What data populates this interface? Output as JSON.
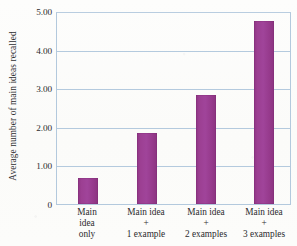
{
  "chart_data": {
    "type": "bar",
    "title": "",
    "subtitle": "",
    "xlabel": "",
    "ylabel": "Average number of main ideas recalled",
    "categories": [
      "Main idea only",
      "Main idea + 1 example",
      "Main idea + 2 examples",
      "Main idea + 3 examples"
    ],
    "category_lines": [
      [
        "Main",
        "idea",
        "only"
      ],
      [
        "Main idea",
        "+",
        "1 example"
      ],
      [
        "Main idea",
        "+",
        "2 examples"
      ],
      [
        "Main idea",
        "+",
        "3 examples"
      ]
    ],
    "values": [
      0.67,
      1.84,
      2.83,
      4.75
    ],
    "ylim": [
      0,
      5
    ],
    "ytick_values": [
      0,
      1,
      2,
      3,
      4,
      5
    ],
    "ytick_labels": [
      "0",
      "1.00",
      "2.00",
      "3.00",
      "4.00",
      "5.00"
    ],
    "grid": true,
    "grid_axis": "y",
    "legend": false,
    "legend_position": "none",
    "bar_color": "#9b3f91",
    "grid_color": "#b0c7dc",
    "axis_color": "#b3c9dd",
    "text_color": "#2b2b2d",
    "background_color": "#fdfdfb"
  }
}
